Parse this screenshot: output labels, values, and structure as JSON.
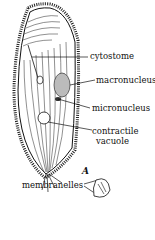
{
  "figure": {
    "panel_label": "A",
    "labels": {
      "cytostome": "cytostome",
      "macronucleus": "macronucleus",
      "micronucleus": "micronucleus",
      "contractile_vacuole_line1": "contractile",
      "contractile_vacuole_line2": "vacuole",
      "membranelles": "membranelles"
    }
  }
}
